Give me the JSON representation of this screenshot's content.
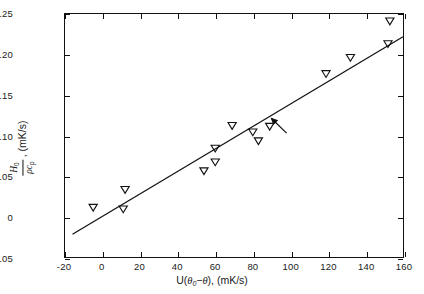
{
  "chart_data": {
    "type": "scatter",
    "title": "",
    "xlabel": "U(θ₀-θ), (mK/s)",
    "ylabel": "H₀/ρcₚ, (mK/s)",
    "xlim": [
      -20,
      160
    ],
    "ylim": [
      -0.05,
      0.25
    ],
    "xticks": [
      -20,
      0,
      20,
      40,
      60,
      80,
      100,
      120,
      140,
      160
    ],
    "xticklabels": [
      "-20",
      "0",
      "20",
      "40",
      "60",
      "80",
      "100",
      "120",
      "140",
      "160"
    ],
    "yticks": [
      -0.05,
      0,
      0.05,
      0.1,
      0.15,
      0.2,
      0.25
    ],
    "yticklabels": [
      "-0.05",
      "0",
      "0.05",
      "0.10",
      "0.15",
      "0.20",
      "0.25"
    ],
    "grid": false,
    "legend": "none",
    "marker": "open-down-triangle",
    "series": [
      {
        "name": "measurements",
        "points": [
          [
            -5,
            0.011
          ],
          [
            11,
            0.009
          ],
          [
            12,
            0.033
          ],
          [
            54,
            0.056
          ],
          [
            60,
            0.084
          ],
          [
            60,
            0.067
          ],
          [
            69,
            0.112
          ],
          [
            80,
            0.104
          ],
          [
            83,
            0.093
          ],
          [
            89,
            0.111
          ],
          [
            119,
            0.176
          ],
          [
            132,
            0.196
          ],
          [
            152,
            0.213
          ],
          [
            153,
            0.241
          ]
        ]
      }
    ],
    "fit_line": {
      "name": "linear-fit",
      "x_start": -16,
      "y_start": -0.022,
      "x_end": 160,
      "y_end": 0.222
    },
    "annotations": [
      {
        "name": "pointer-arrow",
        "tail_x": 98,
        "tail_y": 0.103,
        "head_x": 90,
        "head_y": 0.121
      }
    ]
  },
  "axis_titles": {
    "x": {
      "prefix": "U(",
      "theta_sym": "θ",
      "theta_sub": "0",
      "minus": "−",
      "theta2": "θ",
      "suffix": "), (mK/s)"
    },
    "y": {
      "numerator_sym": "H",
      "numerator_sub": "0",
      "denominator_rho": "ρ",
      "denominator_c": "c",
      "denominator_sub": "p",
      "units": ", (mK/s)"
    }
  },
  "colors": {
    "axis": "#111111",
    "marker_stroke": "#111111",
    "fit_line": "#111111",
    "background": "#ffffff"
  }
}
